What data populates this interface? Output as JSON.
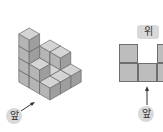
{
  "diagram": {
    "left_view": {
      "label": "앞",
      "description": "Isometric stack of unit cubes",
      "colors": {
        "top": "#d4d4d4",
        "left": "#b5b5b5",
        "right": "#9e9e9e",
        "edge": "#6a6a6a"
      }
    },
    "right_view": {
      "label_top": "위",
      "label_bottom": "앞",
      "grid": [
        [
          1,
          0,
          1
        ],
        [
          1,
          1,
          1
        ]
      ],
      "cell_color": "#bdbdbd"
    }
  }
}
